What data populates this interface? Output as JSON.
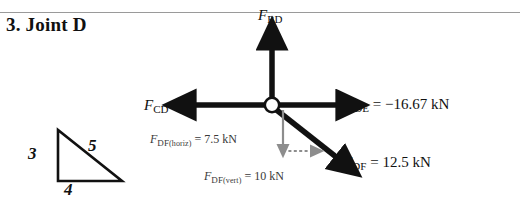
{
  "page": {
    "title": "3. Joint D",
    "background_color": "#ffffff",
    "ink_color": "#111111",
    "component_color": "#808080"
  },
  "triangle": {
    "name": "3-4-5 slope triangle",
    "vertical_label": "3",
    "hypotenuse_label": "5",
    "base_label": "4"
  },
  "forces": {
    "bd": {
      "symbol": "F",
      "subscript": "BD",
      "direction": "up",
      "label_text": "F_BD",
      "value_text": ""
    },
    "cd": {
      "symbol": "F",
      "subscript": "CD",
      "direction": "left",
      "label_text": "F_CD",
      "value_text": ""
    },
    "de": {
      "symbol": "F",
      "subscript": "DE",
      "direction": "right",
      "equals": "=",
      "value": "−16.67",
      "unit": "kN",
      "value_text": "= −16.67 kN"
    },
    "df": {
      "symbol": "F",
      "subscript": "DF",
      "direction": "down-right",
      "equals": "=",
      "value": "12.5",
      "unit": "kN",
      "value_text": "= 12.5 kN"
    },
    "df_horiz": {
      "symbol": "F",
      "subscript": "DF",
      "qualifier": "(horiz)",
      "equals": "=",
      "value": "7.5",
      "unit": "kN",
      "value_text": "= 7.5 kN"
    },
    "df_vert": {
      "symbol": "F",
      "subscript": "DF",
      "qualifier": "(vert)",
      "equals": "=",
      "value": "10",
      "unit": "kN",
      "value_text": "= 10 kN"
    }
  },
  "joint": {
    "name": "joint-node-D",
    "shape": "open circle"
  }
}
